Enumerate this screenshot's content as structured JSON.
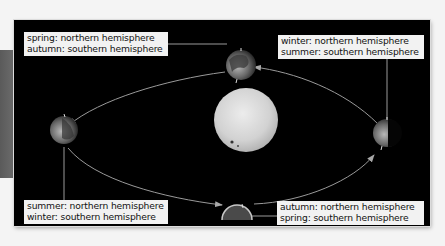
{
  "diagram": {
    "title": "",
    "background": "#000000",
    "center_body": {
      "name": "Sun",
      "color": "#d8d8d8"
    },
    "orbit_color": "#9a9a9a",
    "positions": [
      {
        "id": "top",
        "label": {
          "line1": "spring: northern hemisphere",
          "line2": "autumn: southern hemisphere"
        }
      },
      {
        "id": "right",
        "label": {
          "line1": "winter: northern hemisphere",
          "line2": "summer: southern hemisphere"
        }
      },
      {
        "id": "left",
        "label": {
          "line1": "summer: northern hemisphere",
          "line2": "winter: southern hemisphere"
        }
      },
      {
        "id": "bottom",
        "label": {
          "line1": "autumn: northern hemisphere",
          "line2": "spring: southern hemisphere"
        }
      }
    ]
  }
}
